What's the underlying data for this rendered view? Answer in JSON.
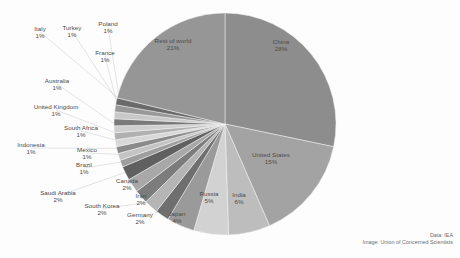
{
  "credits": {
    "data_line": "Data: IEA",
    "image_line": "Image: Union of Concerned Scientists"
  },
  "chart_data": {
    "type": "pie",
    "title": "",
    "subtitle": "",
    "xlabel": "",
    "ylabel": "",
    "legend_position": "none",
    "grid": false,
    "units": "percent",
    "start_angle_deg": 0,
    "direction": "clockwise",
    "categories": [
      "China",
      "United States",
      "India",
      "Russia",
      "Japan",
      "Germany",
      "South Korea",
      "Iran",
      "Canada",
      "Saudi Arabia",
      "Brazil",
      "Mexico",
      "Indonesia",
      "South Africa",
      "United Kingdom",
      "Australia",
      "France",
      "Poland",
      "Turkey",
      "Italy",
      "Rest of world"
    ],
    "values": [
      28,
      15,
      6,
      5,
      4,
      2,
      2,
      2,
      2,
      2,
      1,
      1,
      1,
      1,
      1,
      1,
      1,
      1,
      1,
      1,
      21
    ],
    "slices": [
      {
        "name": "China",
        "label": "China",
        "pct": "28%",
        "value": 28,
        "color": "#8d8d8d",
        "label_placement": "inside"
      },
      {
        "name": "United States",
        "label": "United States",
        "pct": "15%",
        "value": 15,
        "color": "#a3a3a3",
        "label_placement": "inside"
      },
      {
        "name": "India",
        "label": "India",
        "pct": "6%",
        "value": 6,
        "color": "#bdbdbd",
        "label_placement": "inside"
      },
      {
        "name": "Russia",
        "label": "Russia",
        "pct": "5%",
        "value": 5,
        "color": "#d2d2d2",
        "label_placement": "inside"
      },
      {
        "name": "Japan",
        "label": "Japan",
        "pct": "4%",
        "value": 4,
        "color": "#9a9a9a",
        "label_placement": "outside"
      },
      {
        "name": "Germany",
        "label": "Germany",
        "pct": "2%",
        "value": 2,
        "color": "#6f6f6f",
        "label_placement": "outside"
      },
      {
        "name": "South Korea",
        "label": "South Korea",
        "pct": "2%",
        "value": 2,
        "color": "#b5b5b5",
        "label_placement": "outside"
      },
      {
        "name": "Iran",
        "label": "Iran",
        "pct": "2%",
        "value": 2,
        "color": "#7c7c7c",
        "label_placement": "outside"
      },
      {
        "name": "Canada",
        "label": "Canada",
        "pct": "2%",
        "value": 2,
        "color": "#a8a8a8",
        "label_placement": "outside"
      },
      {
        "name": "Saudi Arabia",
        "label": "Saudi Arabia",
        "pct": "2%",
        "value": 2,
        "color": "#606060",
        "label_placement": "outside"
      },
      {
        "name": "Brazil",
        "label": "Brazil",
        "pct": "1%",
        "value": 1,
        "color": "#9e9e9e",
        "label_placement": "outside"
      },
      {
        "name": "Mexico",
        "label": "Mexico",
        "pct": "1%",
        "value": 1,
        "color": "#c4c4c4",
        "label_placement": "outside"
      },
      {
        "name": "Indonesia",
        "label": "Indonesia",
        "pct": "1%",
        "value": 1,
        "color": "#8a8a8a",
        "label_placement": "outside"
      },
      {
        "name": "South Africa",
        "label": "South Africa",
        "pct": "1%",
        "value": 1,
        "color": "#d8d8d8",
        "label_placement": "outside"
      },
      {
        "name": "United Kingdom",
        "label": "United Kingdom",
        "pct": "1%",
        "value": 1,
        "color": "#b0b0b0",
        "label_placement": "outside"
      },
      {
        "name": "Australia",
        "label": "Australia",
        "pct": "1%",
        "value": 1,
        "color": "#cfcfcf",
        "label_placement": "outside"
      },
      {
        "name": "France",
        "label": "France",
        "pct": "1%",
        "value": 1,
        "color": "#7a7a7a",
        "label_placement": "outside"
      },
      {
        "name": "Poland",
        "label": "Poland",
        "pct": "1%",
        "value": 1,
        "color": "#c9c9c9",
        "label_placement": "outside"
      },
      {
        "name": "Turkey",
        "label": "Turkey",
        "pct": "1%",
        "value": 1,
        "color": "#989898",
        "label_placement": "outside"
      },
      {
        "name": "Italy",
        "label": "Italy",
        "pct": "1%",
        "value": 1,
        "color": "#6a6a6a",
        "label_placement": "outside"
      },
      {
        "name": "Rest of world",
        "label": "Rest of world",
        "pct": "21%",
        "value": 21,
        "color": "#969696",
        "label_placement": "inside"
      }
    ],
    "label_positions": [
      {
        "name": "China",
        "x": 281,
        "y": 45,
        "anchor": "middle"
      },
      {
        "name": "United States",
        "x": 271,
        "y": 158,
        "anchor": "middle"
      },
      {
        "name": "India",
        "x": 239,
        "y": 198,
        "anchor": "middle"
      },
      {
        "name": "Russia",
        "x": 209,
        "y": 197,
        "anchor": "middle"
      },
      {
        "name": "Rest of world",
        "x": 173,
        "y": 44,
        "anchor": "middle"
      },
      {
        "name": "Japan",
        "x": 177,
        "y": 217,
        "anchor": "middle"
      },
      {
        "name": "Germany",
        "x": 140,
        "y": 218,
        "anchor": "middle"
      },
      {
        "name": "South Korea",
        "x": 102,
        "y": 209,
        "anchor": "middle"
      },
      {
        "name": "Iran",
        "x": 141,
        "y": 199,
        "anchor": "middle"
      },
      {
        "name": "Canada",
        "x": 127,
        "y": 184,
        "anchor": "middle"
      },
      {
        "name": "Saudi Arabia",
        "x": 58,
        "y": 196,
        "anchor": "middle"
      },
      {
        "name": "Brazil",
        "x": 84,
        "y": 168,
        "anchor": "middle"
      },
      {
        "name": "Mexico",
        "x": 87,
        "y": 153,
        "anchor": "middle"
      },
      {
        "name": "Indonesia",
        "x": 31,
        "y": 148,
        "anchor": "middle"
      },
      {
        "name": "South Africa",
        "x": 81,
        "y": 131,
        "anchor": "middle"
      },
      {
        "name": "United Kingdom",
        "x": 56,
        "y": 110,
        "anchor": "middle"
      },
      {
        "name": "Australia",
        "x": 57,
        "y": 84,
        "anchor": "middle"
      },
      {
        "name": "France",
        "x": 105,
        "y": 56,
        "anchor": "middle"
      },
      {
        "name": "Poland",
        "x": 108,
        "y": 27,
        "anchor": "middle"
      },
      {
        "name": "Turkey",
        "x": 72,
        "y": 31,
        "anchor": "middle"
      },
      {
        "name": "Italy",
        "x": 40,
        "y": 32,
        "anchor": "middle"
      }
    ]
  }
}
